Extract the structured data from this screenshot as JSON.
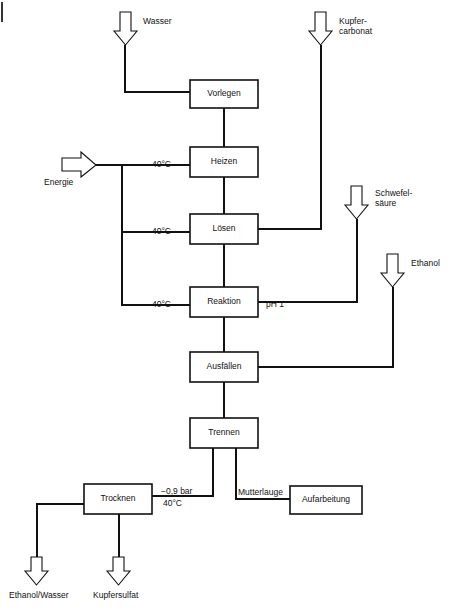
{
  "diagram": {
    "type": "process-flow-diagram",
    "language": "de",
    "line_color": "#111111",
    "background": "#ffffff",
    "process_boxes": [
      {
        "id": "vorlegen",
        "label": "Vorlegen",
        "x": 190,
        "y": 80,
        "w": 68,
        "h": 28
      },
      {
        "id": "heizen",
        "label": "Heizen",
        "x": 190,
        "y": 147,
        "w": 68,
        "h": 30
      },
      {
        "id": "loesen",
        "label": "Lösen",
        "x": 190,
        "y": 214,
        "w": 68,
        "h": 30
      },
      {
        "id": "reaktion",
        "label": "Reaktion",
        "x": 190,
        "y": 287,
        "w": 68,
        "h": 30
      },
      {
        "id": "ausfaellen",
        "label": "Ausfällen",
        "x": 190,
        "y": 352,
        "w": 68,
        "h": 30
      },
      {
        "id": "trennen",
        "label": "Trennen",
        "x": 190,
        "y": 418,
        "w": 68,
        "h": 30
      },
      {
        "id": "trocknen",
        "label": "Trocknen",
        "x": 84,
        "y": 484,
        "w": 68,
        "h": 30
      },
      {
        "id": "aufarbeitung",
        "label": "Aufarbeitung",
        "x": 290,
        "y": 486,
        "w": 72,
        "h": 28
      }
    ],
    "input_arrows": [
      {
        "id": "wasser",
        "label": "Wasser",
        "direction": "down",
        "x": 118,
        "y": 12
      },
      {
        "id": "kupfercarbonat",
        "label": "Kupfer-\ncarbonat",
        "direction": "down",
        "x": 314,
        "y": 12
      },
      {
        "id": "energie",
        "label": "Energie",
        "direction": "right",
        "x": 62,
        "y": 155
      },
      {
        "id": "schwefelsaeure",
        "label": "Schwefel-\nsäure",
        "direction": "down",
        "x": 350,
        "y": 186
      },
      {
        "id": "ethanol",
        "label": "Ethanol",
        "direction": "down",
        "x": 386,
        "y": 254
      }
    ],
    "output_arrows": [
      {
        "id": "ethanol-wasser",
        "label": "Ethanol/Wasser",
        "direction": "down",
        "x": 30,
        "y": 557
      },
      {
        "id": "kupfersulfat",
        "label": "Kupfersulfat",
        "direction": "down",
        "x": 112,
        "y": 557
      }
    ],
    "stream_labels": [
      {
        "id": "temp-heizen",
        "text": "40°C",
        "x": 152,
        "y": 160
      },
      {
        "id": "temp-loesen",
        "text": "40°C",
        "x": 152,
        "y": 227
      },
      {
        "id": "temp-reaktion",
        "text": "40°C",
        "x": 152,
        "y": 300
      },
      {
        "id": "ph-reaktion",
        "text": "pH 1",
        "x": 266,
        "y": 300
      },
      {
        "id": "pressure-dry",
        "text": "−0,9 bar",
        "x": 161,
        "y": 488
      },
      {
        "id": "temp-trocknen",
        "text": "40°C",
        "x": 161,
        "y": 500
      },
      {
        "id": "mutterlauge",
        "text": "Mutterlauge",
        "x": 234,
        "y": 488
      }
    ]
  }
}
